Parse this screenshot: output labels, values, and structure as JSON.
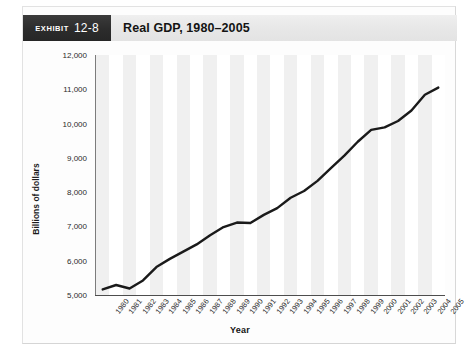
{
  "header": {
    "badge_label": "Exhibit",
    "badge_number": "12-8",
    "title": "Real GDP, 1980–2005"
  },
  "chart_data": {
    "type": "line",
    "title": "Real GDP, 1980–2005",
    "xlabel": "Year",
    "ylabel": "Billions of dollars",
    "ylim": [
      5000,
      12000
    ],
    "ytick_values": [
      5000,
      6000,
      7000,
      8000,
      9000,
      10000,
      11000,
      12000
    ],
    "ytick_labels": [
      "5,000",
      "6,000",
      "7,000",
      "8,000",
      "9,000",
      "10,000",
      "11,000",
      "12,000"
    ],
    "grid": false,
    "legend": "none",
    "band_shading": "alternating vertical gray bands, one per year",
    "line_color": "#1a1a1a",
    "categories": [
      "1980",
      "1981",
      "1982",
      "1983",
      "1984",
      "1985",
      "1986",
      "1987",
      "1988",
      "1989",
      "1990",
      "1991",
      "1992",
      "1993",
      "1994",
      "1995",
      "1996",
      "1997",
      "1998",
      "1999",
      "2000",
      "2001",
      "2002",
      "2003",
      "2004",
      "2005"
    ],
    "x": [
      1980,
      1981,
      1982,
      1983,
      1984,
      1985,
      1986,
      1987,
      1988,
      1989,
      1990,
      1991,
      1992,
      1993,
      1994,
      1995,
      1996,
      1997,
      1998,
      1999,
      2000,
      2001,
      2002,
      2003,
      2004,
      2005
    ],
    "values": [
      5162,
      5292,
      5189,
      5424,
      5814,
      6054,
      6264,
      6475,
      6743,
      6981,
      7113,
      7101,
      7337,
      7533,
      7836,
      8032,
      8329,
      8704,
      9067,
      9470,
      9817,
      9891,
      10075,
      10381,
      10842,
      11049
    ],
    "annotations": [
      "1980–1982 recession dip",
      "1990–1991 flattening",
      "2000–2001 slowdown plateau"
    ]
  }
}
